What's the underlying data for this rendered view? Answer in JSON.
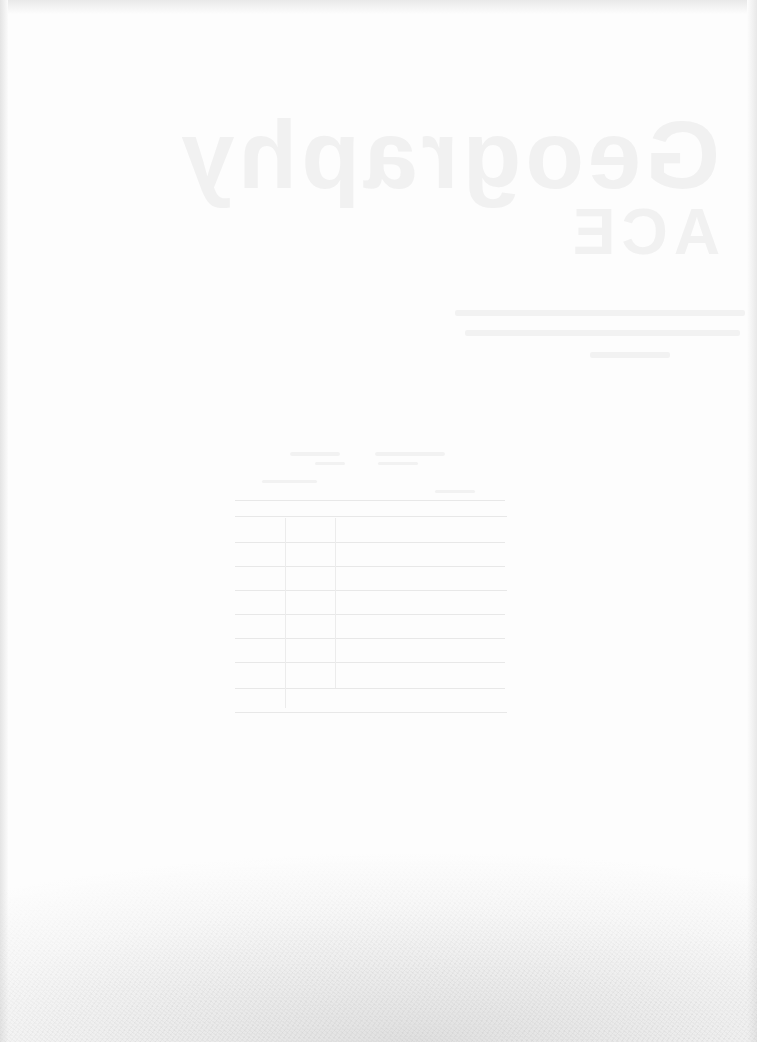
{
  "page": {
    "type": "scanned blank page with reverse-side show-through",
    "background": "#fdfdfd"
  },
  "show_through": {
    "title_line_1": "Geography",
    "title_line_2": "ACE",
    "text_lines": [
      {
        "left": 455,
        "top": 310,
        "width": 290
      },
      {
        "left": 465,
        "top": 330,
        "width": 275
      },
      {
        "left": 590,
        "top": 352,
        "width": 80
      }
    ],
    "table": {
      "header_fragment": "",
      "rows": 9,
      "columns": 3
    },
    "caption": ""
  },
  "colors": {
    "ghost_text": "#f1f1f1",
    "grain": "#c8c8c8"
  }
}
